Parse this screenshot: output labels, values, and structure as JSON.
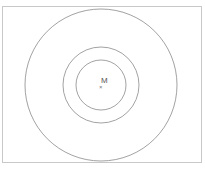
{
  "figure": {
    "caption": "",
    "center_label": "M",
    "center_marker": "×",
    "stroke_color": "#8a8a8a",
    "frame_color": "#c8c8c8",
    "circles": [
      {
        "name": "inner-circle",
        "cx": 101,
        "cy": 85,
        "r": 25
      },
      {
        "name": "middle-circle",
        "cx": 101,
        "cy": 85,
        "r": 38
      },
      {
        "name": "outer-circle",
        "cx": 101,
        "cy": 85,
        "r": 76
      }
    ]
  }
}
